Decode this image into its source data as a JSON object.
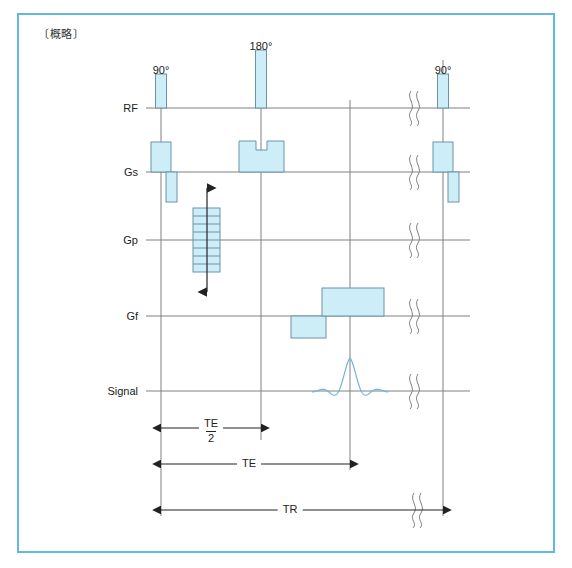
{
  "title": "〔概略〕",
  "frame": {
    "border_color": "#63b8e0"
  },
  "style": {
    "gradient_fill": "#cdeef7",
    "gradient_stroke": "#6a93a8",
    "rf_fill": "#cdeef7",
    "rf_stroke": "#6a93a8",
    "baseline_color": "#808080",
    "guide_color": "#808080",
    "signal_color": "#6fb5dd",
    "arrow_color": "#222222",
    "break_color": "#808080"
  },
  "rows": [
    {
      "key": "rf",
      "label": "RF",
      "y": 108,
      "label_x": 138
    },
    {
      "key": "gs",
      "label": "Gs",
      "y": 172,
      "label_x": 138
    },
    {
      "key": "gp",
      "label": "Gp",
      "y": 240,
      "label_x": 138
    },
    {
      "key": "gf",
      "label": "Gf",
      "y": 316,
      "label_x": 138
    },
    {
      "key": "signal",
      "label": "Signal",
      "y": 391,
      "label_x": 138
    }
  ],
  "axis": {
    "x_start": 146,
    "x_end": 470
  },
  "guides": [
    {
      "name": "guide-90",
      "x": 161,
      "y_top": 100,
      "y_bottom": 516
    },
    {
      "name": "guide-180",
      "x": 261,
      "y_top": 50,
      "y_bottom": 440
    },
    {
      "name": "guide-echo",
      "x": 350,
      "y_top": 100,
      "y_bottom": 470
    },
    {
      "name": "guide-tr-end",
      "x": 443,
      "y_top": 60,
      "y_bottom": 516
    }
  ],
  "rf_pulses": [
    {
      "name": "rf-pulse-90-first",
      "label": "90°",
      "x": 161,
      "width": 11,
      "height": 34,
      "label_y": 64
    },
    {
      "name": "rf-pulse-180",
      "label": "180°",
      "x": 261,
      "width": 11,
      "height": 58,
      "label_y": 40
    },
    {
      "name": "rf-pulse-90-second",
      "label": "90°",
      "x": 443,
      "width": 11,
      "height": 34,
      "label_y": 64
    }
  ],
  "gs_lobes": [
    {
      "name": "gs-slice-select-1",
      "x": 151,
      "width": 20,
      "height": 30,
      "polarity": "positive"
    },
    {
      "name": "gs-rephase-1",
      "x": 166,
      "width": 11,
      "height": 30,
      "polarity": "negative"
    },
    {
      "name": "gs-crusher-180",
      "x": 239,
      "width": 45,
      "height": 31,
      "polarity": "positive",
      "notched": true,
      "notch_width": 11,
      "notch_depth": 9
    },
    {
      "name": "gs-slice-select-2",
      "x": 433,
      "width": 20,
      "height": 30,
      "polarity": "positive"
    },
    {
      "name": "gs-rephase-2",
      "x": 448,
      "width": 11,
      "height": 30,
      "polarity": "negative"
    }
  ],
  "gp_ladder": {
    "name": "gp-phase-encode-ladder",
    "x": 193,
    "width": 27,
    "top": 208,
    "bottom": 272,
    "steps": 8,
    "arrow": {
      "x": 207,
      "y_top": 188,
      "y_bottom": 292
    }
  },
  "gf_lobes": [
    {
      "name": "gf-dephase",
      "x": 291,
      "width": 35,
      "height": 22,
      "polarity": "negative"
    },
    {
      "name": "gf-readout",
      "x": 322,
      "width": 62,
      "height": 28,
      "polarity": "positive"
    }
  ],
  "signal_echo": {
    "name": "signal-echo-waveform",
    "center_x": 350,
    "y": 391,
    "half_width": 38,
    "amplitude": 33
  },
  "breaks": [
    {
      "name": "break-rf",
      "x": 411,
      "y": 108
    },
    {
      "name": "break-gs",
      "x": 411,
      "y": 172
    },
    {
      "name": "break-gp",
      "x": 411,
      "y": 240
    },
    {
      "name": "break-gf",
      "x": 411,
      "y": 316
    },
    {
      "name": "break-signal",
      "x": 411,
      "y": 391
    },
    {
      "name": "break-tr",
      "x": 414,
      "y": 510
    }
  ],
  "timing": [
    {
      "name": "timing-te-half",
      "label_top": "TE",
      "label_bottom": "2",
      "fraction": true,
      "x1": 161,
      "x2": 261,
      "y": 428,
      "label_x": 211,
      "label_y": 418
    },
    {
      "name": "timing-te",
      "label": "TE",
      "fraction": false,
      "x1": 161,
      "x2": 350,
      "y": 464,
      "label_x": 249,
      "label_y": 457
    },
    {
      "name": "timing-tr",
      "label": "TR",
      "fraction": false,
      "x1": 161,
      "x2": 443,
      "y": 510,
      "label_x": 290,
      "label_y": 503,
      "has_break": true
    }
  ]
}
